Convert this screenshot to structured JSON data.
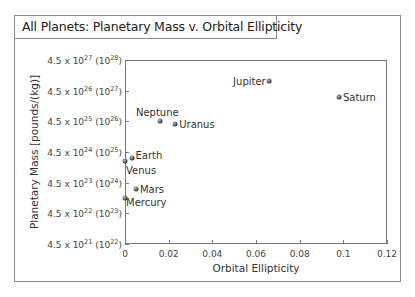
{
  "chart_data": {
    "type": "scatter",
    "title": "All Planets: Planetary Mass v. Orbital Ellipticity",
    "xlabel": "Orbital Ellipticity",
    "ylabel": "Planetary Mass [pounds/(kg)]",
    "xlim": [
      0,
      0.12
    ],
    "yscale": "log",
    "ylim_kg": [
      1e+22,
      1e+28
    ],
    "x_ticks": [
      "0",
      "0.02",
      "0.04",
      "0.06",
      "0.08",
      "0.1",
      "0.12"
    ],
    "y_ticks": [
      {
        "base": "4.5 x 10",
        "exp": "21",
        "alt_exp": "22"
      },
      {
        "base": "4.5 x 10",
        "exp": "22",
        "alt_exp": "23"
      },
      {
        "base": "4.5 x 10",
        "exp": "23",
        "alt_exp": "24"
      },
      {
        "base": "4.5 x 10",
        "exp": "24",
        "alt_exp": "25"
      },
      {
        "base": "4.5 x 10",
        "exp": "25",
        "alt_exp": "26"
      },
      {
        "base": "4.5 x 10",
        "exp": "26",
        "alt_exp": "27"
      },
      {
        "base": "4.5 x 10",
        "exp": "27",
        "alt_exp": "28"
      }
    ],
    "grid": false,
    "points": [
      {
        "name": "Mercury",
        "x": 0.0,
        "log10_mass_kg": 23.5
      },
      {
        "name": "Venus",
        "x": 0.0,
        "log10_mass_kg": 24.7
      },
      {
        "name": "Earth",
        "x": 0.003,
        "log10_mass_kg": 24.8
      },
      {
        "name": "Mars",
        "x": 0.005,
        "log10_mass_kg": 23.8
      },
      {
        "name": "Neptune",
        "x": 0.016,
        "log10_mass_kg": 26.0
      },
      {
        "name": "Uranus",
        "x": 0.023,
        "log10_mass_kg": 25.9
      },
      {
        "name": "Jupiter",
        "x": 0.066,
        "log10_mass_kg": 27.3
      },
      {
        "name": "Saturn",
        "x": 0.098,
        "log10_mass_kg": 26.8
      }
    ]
  }
}
